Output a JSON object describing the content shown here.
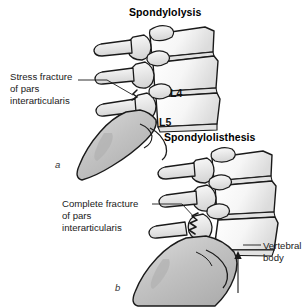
{
  "figure": {
    "width": 308,
    "height": 307,
    "background": "#ffffff",
    "ink_color": "#1a1a1a",
    "bone_fill": "#f4f4f4",
    "bone_shade": "#d8d8d8",
    "sacrum_fill": "#c9c9c9"
  },
  "panels": [
    {
      "letter": "a",
      "title": "Spondylolysis",
      "callout": {
        "line1": "Stress fracture",
        "line2": "of pars",
        "line3": "interarticularis"
      },
      "bone_labels": [
        "L4",
        "L5"
      ]
    },
    {
      "letter": "b",
      "title": "Spondylolisthesis",
      "callout": {
        "line1": "Complete fracture",
        "line2": "of pars",
        "line3": "interarticularis"
      },
      "side_label": {
        "line1": "Vertebral",
        "line2": "body"
      }
    }
  ],
  "titles": {
    "spondylolysis": "Spondylolysis",
    "spondylolisthesis": "Spondylolisthesis"
  },
  "callouts": {
    "stress_fracture_l1": "Stress fracture",
    "stress_fracture_l2": "of pars",
    "stress_fracture_l3": "interarticularis",
    "complete_fracture_l1": "Complete fracture",
    "complete_fracture_l2": "of pars",
    "complete_fracture_l3": "interarticularis"
  },
  "labels": {
    "l4": "L4",
    "l5": "L5",
    "vertebral_body_l1": "Vertebral",
    "vertebral_body_l2": "body",
    "panel_a": "a",
    "panel_b": "b"
  },
  "caption_fragment": ""
}
